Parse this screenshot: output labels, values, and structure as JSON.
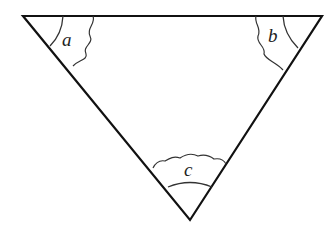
{
  "diagram": {
    "type": "triangle-angles",
    "vertices": {
      "top_left": [
        23,
        16
      ],
      "top_right": [
        322,
        16
      ],
      "bottom": [
        190,
        220
      ]
    },
    "angles": [
      {
        "id": "a",
        "label": "a",
        "vertex": "top_left"
      },
      {
        "id": "b",
        "label": "b",
        "vertex": "top_right"
      },
      {
        "id": "c",
        "label": "c",
        "vertex": "bottom"
      }
    ],
    "colors": {
      "stroke": "#111111",
      "arc": "#333333",
      "label": "#222222",
      "background": "#ffffff"
    }
  }
}
